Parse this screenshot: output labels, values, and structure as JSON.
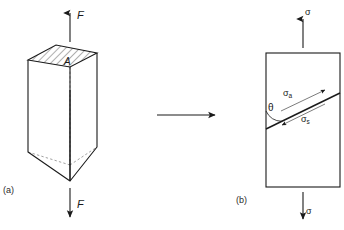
{
  "figure": {
    "background_color": "#ffffff",
    "stroke_color": "#1a1a1a",
    "panels": [
      {
        "id": "panel-a",
        "caption": "(a)",
        "description": "three-dimensional rectangular prism loaded in uniaxial tension",
        "labels": {
          "force_top": "F",
          "force_bottom": "F",
          "area": "A"
        },
        "arrows": [
          {
            "name": "force-arrow-top",
            "direction": "up",
            "label": "F"
          },
          {
            "name": "force-arrow-bottom",
            "direction": "down",
            "label": "F"
          }
        ],
        "hatched_face": {
          "name": "cross-section-area",
          "label": "A",
          "hatch_angle_deg": 45
        }
      },
      {
        "id": "panel-b",
        "caption": "(b)",
        "description": "two-dimensional element showing resolved normal and shear stresses on an inclined plane",
        "labels": {
          "stress_top": "σ",
          "stress_bottom": "σ",
          "normal_stress": "σ",
          "normal_stress_subscript": "a",
          "shear_stress": "σ",
          "shear_stress_subscript": "s",
          "angle": "θ"
        },
        "arrows": [
          {
            "name": "stress-arrow-top",
            "direction": "up",
            "label": "σ"
          },
          {
            "name": "stress-arrow-bottom",
            "direction": "down",
            "label": "σ"
          },
          {
            "name": "normal-stress-arrow",
            "direction": "up-right",
            "label": "σa"
          },
          {
            "name": "shear-stress-arrow",
            "direction": "down-left",
            "label": "σs"
          }
        ],
        "inclined_plane": {
          "name": "inclined-failure-plane",
          "angle_label": "θ",
          "angle_deg": 33
        }
      }
    ],
    "transition_arrow": {
      "name": "transition-arrow",
      "direction": "right"
    }
  }
}
